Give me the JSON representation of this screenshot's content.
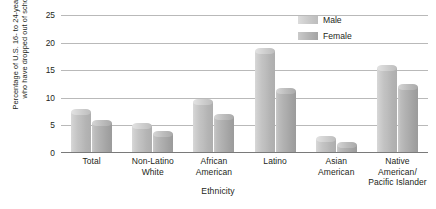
{
  "chart_data": {
    "type": "bar",
    "title": "",
    "xlabel": "Ethnicity",
    "ylabel": "Percentage of U.S. 16- to 24-year-olds\nwho have dropped out of school",
    "categories": [
      "Total",
      "Non-Latino\nWhite",
      "African\nAmerican",
      "Latino",
      "Asian\nAmerican",
      "Native American/\nPacific Islander"
    ],
    "series": [
      {
        "name": "Male",
        "values": [
          8.0,
          5.5,
          9.8,
          19.0,
          3.0,
          16.0
        ],
        "color": "#c4c4c4"
      },
      {
        "name": "Female",
        "values": [
          6.0,
          4.0,
          7.0,
          11.8,
          2.0,
          12.5
        ],
        "color": "#ababab"
      }
    ],
    "ylim": [
      0,
      25
    ],
    "yticks": [
      0,
      5,
      10,
      15,
      20,
      25
    ],
    "ytick_labels": [
      "0",
      "5",
      "10",
      "15",
      "20",
      "25"
    ],
    "grid": true,
    "legend_position": "top-right"
  }
}
